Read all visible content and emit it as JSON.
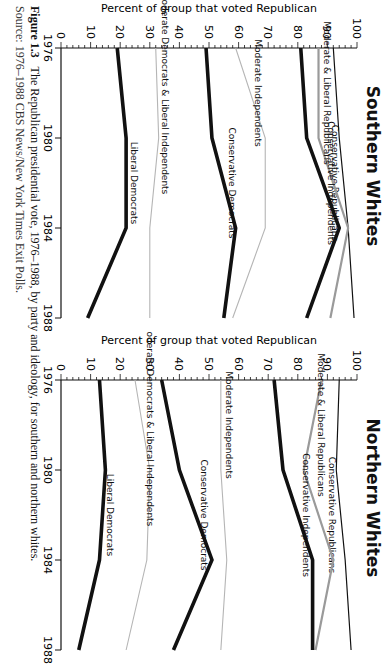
{
  "figure": {
    "label": "Figure 1.3",
    "caption": "The Republican presidential vote, 1976–1988, by party and ideology, for southern and northern whites.",
    "source": "Source: 1976–1988 CBS News/New York Times Exit Polls."
  },
  "chart_data": [
    {
      "type": "line",
      "title": "Southern Whites",
      "xlabel": "",
      "ylabel": "Percent of group that voted Republican",
      "x": [
        1976,
        1980,
        1984,
        1988
      ],
      "ylim": [
        0,
        100
      ],
      "yticks": [
        0,
        10,
        20,
        30,
        40,
        50,
        60,
        70,
        80,
        90,
        100
      ],
      "grid": false,
      "series": [
        {
          "name": "Conservative Republicans",
          "values": [
            92,
            94,
            97,
            99
          ],
          "style": "thin-black"
        },
        {
          "name": "Moderate & Liberal Republicans",
          "values": [
            87,
            87,
            97,
            91
          ],
          "style": "gray"
        },
        {
          "name": "Conservative Independents",
          "values": [
            81,
            83,
            94,
            83
          ],
          "style": "thick-black"
        },
        {
          "name": "Moderate Independents",
          "values": [
            59,
            69,
            69,
            58
          ],
          "style": "light-gray"
        },
        {
          "name": "Conservative Democrats",
          "values": [
            49,
            51,
            59,
            55
          ],
          "style": "thick-black"
        },
        {
          "name": "Moderate Democrats & Liberal Independents",
          "values": [
            32,
            33,
            30,
            30
          ],
          "style": "light-gray"
        },
        {
          "name": "Liberal Democrats",
          "values": [
            19,
            22,
            22,
            9
          ],
          "style": "thick-black"
        }
      ]
    },
    {
      "type": "line",
      "title": "Northern Whites",
      "xlabel": "",
      "ylabel": "Percent of group that voted Republican",
      "x": [
        1976,
        1980,
        1984,
        1988
      ],
      "ylim": [
        0,
        100
      ],
      "yticks": [
        0,
        10,
        20,
        30,
        40,
        50,
        60,
        70,
        80,
        90,
        100
      ],
      "grid": false,
      "series": [
        {
          "name": "Conservative Republicans",
          "values": [
            94,
            93,
            96,
            98
          ],
          "style": "thin-black"
        },
        {
          "name": "Moderate & Liberal Republicans",
          "values": [
            88,
            82,
            92,
            86
          ],
          "style": "gray"
        },
        {
          "name": "Conservative Independents",
          "values": [
            72,
            75,
            85,
            85
          ],
          "style": "thick-black"
        },
        {
          "name": "Moderate Independents",
          "values": [
            54,
            54,
            56,
            54
          ],
          "style": "light-gray"
        },
        {
          "name": "Conservative Democrats",
          "values": [
            34,
            40,
            51,
            38
          ],
          "style": "thick-black"
        },
        {
          "name": "Moderate Democrats & Liberal Independents",
          "values": [
            25,
            30,
            29,
            22
          ],
          "style": "light-gray"
        },
        {
          "name": "Liberal Democrats",
          "values": [
            13,
            15,
            13,
            6
          ],
          "style": "thick-black"
        }
      ]
    }
  ],
  "styles": {
    "thin-black": {
      "color": "#111111",
      "width": 1.2
    },
    "gray": {
      "color": "#9a9a9a",
      "width": 2.2
    },
    "thick-black": {
      "color": "#111111",
      "width": 3.6
    },
    "light-gray": {
      "color": "#b5b5b5",
      "width": 1.1
    }
  }
}
